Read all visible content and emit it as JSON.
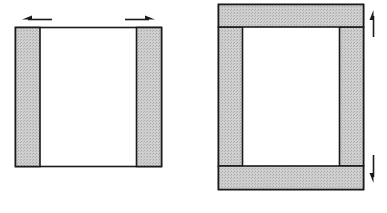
{
  "figures": [
    {
      "id": "horizontal-expansion",
      "description": "Rectangle with shaded left and right side strips; arrows point outward horizontally",
      "outer": {
        "x": 15,
        "y": 27,
        "w": 147,
        "h": 140
      },
      "strips": [
        {
          "name": "left-strip",
          "x": 15,
          "y": 27,
          "w": 25,
          "h": 140
        },
        {
          "name": "right-strip",
          "x": 136,
          "y": 27,
          "w": 26,
          "h": 140
        }
      ],
      "arrows": [
        {
          "name": "left-arrow",
          "direction": "left"
        },
        {
          "name": "right-arrow",
          "direction": "right"
        }
      ]
    },
    {
      "id": "vertical-expansion",
      "description": "Rectangle framed by shaded top, bottom, left and right strips; arrows point outward vertically",
      "outer": {
        "x": 218,
        "y": 4,
        "w": 146,
        "h": 186
      },
      "strips": [
        {
          "name": "top-strip",
          "x": 218,
          "y": 4,
          "w": 146,
          "h": 23
        },
        {
          "name": "bottom-strip",
          "x": 218,
          "y": 166,
          "w": 146,
          "h": 24
        },
        {
          "name": "left-strip",
          "x": 218,
          "y": 27,
          "w": 24,
          "h": 139
        },
        {
          "name": "right-strip",
          "x": 340,
          "y": 27,
          "w": 24,
          "h": 139
        }
      ],
      "arrows": [
        {
          "name": "up-arrow",
          "direction": "up"
        },
        {
          "name": "down-arrow",
          "direction": "down"
        }
      ]
    }
  ],
  "colors": {
    "shade": "#c8c8c8",
    "stroke": "#1a1a1a",
    "fill": "#ffffff"
  }
}
